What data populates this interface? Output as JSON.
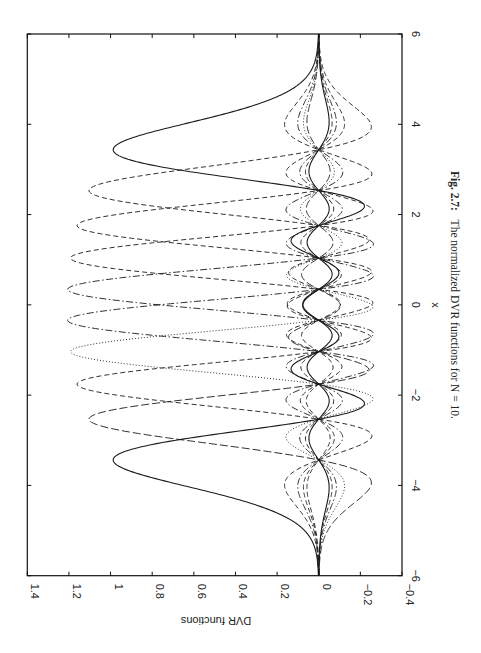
{
  "chart_data": {
    "type": "line",
    "title": "",
    "xlabel": "x",
    "ylabel": "DVR functions",
    "xlim": [
      -6,
      6
    ],
    "ylim": [
      -0.4,
      1.4
    ],
    "xticks": [
      -6,
      -4,
      -2,
      0,
      2,
      4,
      6
    ],
    "yticks": [
      -0.4,
      -0.2,
      0,
      0.2,
      0.4,
      0.6,
      0.8,
      1,
      1.2,
      1.4
    ],
    "xtick_labels": [
      "−6",
      "−4",
      "−2",
      "0",
      "2",
      "4",
      "6"
    ],
    "ytick_labels": [
      "−0.4",
      "−0.2",
      "0",
      "0.2",
      "0.4",
      "0.6",
      "0.8",
      "1",
      "1.2",
      "1.4"
    ],
    "grid": false,
    "legend": null,
    "orientation": "page rotated 90 degrees clockwise",
    "N": 10,
    "dvr_points": [
      -3.4362,
      -2.5327,
      -1.7567,
      -1.0366,
      -0.3429,
      0.3429,
      1.0366,
      1.7567,
      2.5327,
      3.4362
    ],
    "peak_values": [
      0.99,
      1.1,
      1.16,
      1.19,
      1.2,
      1.2,
      1.19,
      1.16,
      1.1,
      0.99
    ],
    "min_value_approx": -0.21,
    "series": [
      {
        "name": "chi_1",
        "center": -3.4362,
        "style": "solid"
      },
      {
        "name": "chi_2",
        "center": -2.5327,
        "style": "longdash"
      },
      {
        "name": "chi_3",
        "center": -1.7567,
        "style": "dashed"
      },
      {
        "name": "chi_4",
        "center": -1.0366,
        "style": "dotted"
      },
      {
        "name": "chi_5",
        "center": -0.3429,
        "style": "dashdot"
      },
      {
        "name": "chi_6",
        "center": 0.3429,
        "style": "dashdot"
      },
      {
        "name": "chi_7",
        "center": 1.0366,
        "style": "dashed"
      },
      {
        "name": "chi_8",
        "center": 1.7567,
        "style": "dashed"
      },
      {
        "name": "chi_9",
        "center": 2.5327,
        "style": "dashed"
      },
      {
        "name": "chi_10",
        "center": 3.4362,
        "style": "solid"
      }
    ]
  },
  "caption": {
    "label": "Fig. 2.7:",
    "text": "The normalized DVR functions for N = 10."
  },
  "colors": {
    "line": "#1a1a1a",
    "axis": "#111111",
    "background": "#ffffff"
  }
}
